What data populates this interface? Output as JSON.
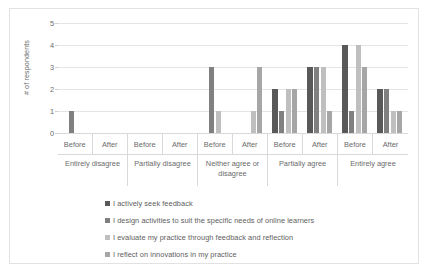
{
  "chart_data": {
    "type": "bar",
    "title": "",
    "xlabel": "",
    "ylabel": "# of respondents",
    "ylim": [
      0,
      5
    ],
    "ytick_labels": [
      "5",
      "4",
      "3",
      "2",
      "1",
      "0"
    ],
    "ytick_values": [
      5,
      4,
      3,
      2,
      1,
      0
    ],
    "grid": true,
    "legend_position": "bottom",
    "group_labels": [
      "Entirely disagree",
      "Partially disagree",
      "Neither agree or disagree",
      "Partially agree",
      "Entirely agree"
    ],
    "subgroup_labels": [
      "Before",
      "After"
    ],
    "categories": [
      "Entirely disagree - Before",
      "Entirely disagree - After",
      "Partially disagree - Before",
      "Partially disagree - After",
      "Neither agree or disagree - Before",
      "Neither agree or disagree - After",
      "Partially agree - Before",
      "Partially agree - After",
      "Entirely agree - Before",
      "Entirely agree - After"
    ],
    "series": [
      {
        "name": "I actively seek feedback",
        "color": "#595959",
        "values": [
          0,
          0,
          0,
          0,
          0,
          0,
          2,
          3,
          4,
          2
        ]
      },
      {
        "name": "I design activities to suit the specific needs of online learners",
        "color": "#808080",
        "values": [
          1,
          0,
          0,
          0,
          3,
          0,
          1,
          3,
          1,
          2
        ]
      },
      {
        "name": "I evaluate my practice through feedback and reflection",
        "color": "#bfbfbf",
        "values": [
          0,
          0,
          0,
          0,
          1,
          1,
          2,
          3,
          4,
          1
        ]
      },
      {
        "name": "I reflect on innovations in my practice",
        "color": "#a6a6a6",
        "values": [
          0,
          0,
          0,
          0,
          0,
          3,
          2,
          1,
          3,
          1
        ]
      }
    ]
  },
  "legend": {
    "items": [
      {
        "label": "I actively seek feedback",
        "color": "#595959"
      },
      {
        "label": "I design activities to suit the specific needs of online learners",
        "color": "#808080"
      },
      {
        "label": "I evaluate my practice through feedback and reflection",
        "color": "#bfbfbf"
      },
      {
        "label": "I reflect on innovations in my practice",
        "color": "#a6a6a6"
      }
    ]
  }
}
